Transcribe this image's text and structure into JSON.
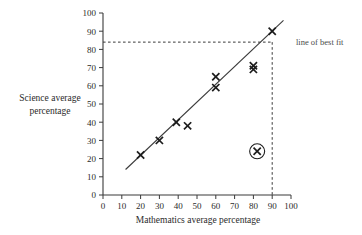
{
  "figure": {
    "title": "",
    "background_color": "#ffffff",
    "ink_color": "#2b2b2b"
  },
  "axes": {
    "x_title": "Mathematics average percentage",
    "y_title_line1": "Science average",
    "y_title_line2": "percentage"
  },
  "annotations": {
    "best_fit_label": "line of best fit"
  },
  "chart_data": {
    "type": "scatter",
    "title": "",
    "xlabel": "Mathematics average percentage",
    "ylabel": "Science average percentage",
    "xlim": [
      0,
      100
    ],
    "ylim": [
      0,
      100
    ],
    "xticks": [
      0,
      10,
      20,
      30,
      40,
      50,
      60,
      70,
      80,
      90,
      100
    ],
    "yticks": [
      0,
      10,
      20,
      30,
      40,
      50,
      60,
      70,
      80,
      90,
      100
    ],
    "grid": false,
    "legend": null,
    "marker": "x",
    "points": [
      {
        "x": 20,
        "y": 22
      },
      {
        "x": 30,
        "y": 30
      },
      {
        "x": 39,
        "y": 40
      },
      {
        "x": 45,
        "y": 38
      },
      {
        "x": 60,
        "y": 65
      },
      {
        "x": 60,
        "y": 59
      },
      {
        "x": 80,
        "y": 71
      },
      {
        "x": 80,
        "y": 69
      },
      {
        "x": 90,
        "y": 90
      }
    ],
    "highlighted_point": {
      "x": 82,
      "y": 24,
      "marker": "circled-x",
      "label": "outlier"
    },
    "trend_line": {
      "name": "line of best fit",
      "x_start": 12,
      "y_start": 14,
      "x_end": 96,
      "y_end": 96
    },
    "reference_lines": [
      {
        "name": "prediction-guide",
        "style": "dashed",
        "x_value": 90,
        "y_value": 84,
        "from": [
          0,
          84
        ],
        "to": [
          90,
          84
        ],
        "then_to": [
          90,
          0
        ]
      }
    ]
  }
}
